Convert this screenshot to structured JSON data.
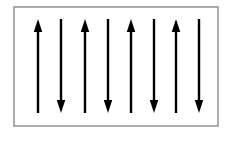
{
  "figure": {
    "description": "A rectangular frame containing eight equally spaced vertical arrows of equal length whose directions alternate: up, down, up, down, up, down, up, down.",
    "background_color": "#ffffff",
    "arrow_color": "#000000",
    "frame": {
      "label": "figure-border",
      "stroke_color": "#8a8a8a",
      "stroke_width": 1.4,
      "x": 14,
      "y": 7,
      "width": 204,
      "height": 119,
      "fill": "#ffffff"
    },
    "geometry": {
      "arrow_count": 8,
      "arrow_top_y": 19,
      "arrow_bottom_y": 113,
      "arrow_length": 94,
      "shaft_width": 2.4,
      "head_width": 8.5,
      "head_length": 13,
      "x_positions": [
        38,
        61,
        85,
        108,
        131,
        154,
        176,
        199
      ]
    },
    "arrows": [
      {
        "id": "arrow-1",
        "index": 1,
        "x": 38,
        "direction": "up",
        "label": "up"
      },
      {
        "id": "arrow-2",
        "index": 2,
        "x": 61,
        "direction": "down",
        "label": "down"
      },
      {
        "id": "arrow-3",
        "index": 3,
        "x": 85,
        "direction": "up",
        "label": "up"
      },
      {
        "id": "arrow-4",
        "index": 4,
        "x": 108,
        "direction": "down",
        "label": "down"
      },
      {
        "id": "arrow-5",
        "index": 5,
        "x": 131,
        "direction": "up",
        "label": "up"
      },
      {
        "id": "arrow-6",
        "index": 6,
        "x": 154,
        "direction": "down",
        "label": "down"
      },
      {
        "id": "arrow-7",
        "index": 7,
        "x": 176,
        "direction": "up",
        "label": "up"
      },
      {
        "id": "arrow-8",
        "index": 8,
        "x": 199,
        "direction": "down",
        "label": "down"
      }
    ]
  }
}
